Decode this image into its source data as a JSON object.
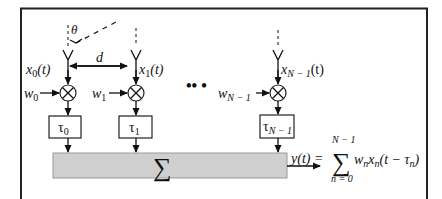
{
  "diagram": {
    "angle_label": "θ",
    "spacing_label": "d",
    "ellipsis": "•• •",
    "sum_symbol": "∑",
    "elements": [
      {
        "signal": "x",
        "signal_sub": "0",
        "signal_arg": "(t)",
        "weight": "w",
        "weight_sub": "0",
        "delay": "τ",
        "delay_sub": "0"
      },
      {
        "signal": "x",
        "signal_sub": "1",
        "signal_arg": "(t)",
        "weight": "w",
        "weight_sub": "1",
        "delay": "τ",
        "delay_sub": "1"
      },
      {
        "signal": "x",
        "signal_sub": "N − 1",
        "signal_arg": "(t)",
        "weight": "w",
        "weight_sub": "N − 1",
        "delay": "τ",
        "delay_sub": "N − 1"
      }
    ],
    "output": {
      "lhs": "y(t) =",
      "sum_symbol": "∑",
      "upper_limit": "N − 1",
      "lower_limit": "n = 0",
      "term_w": "w",
      "term_w_sub": "n",
      "term_x": "x",
      "term_x_sub": "n",
      "term_arg_open": "(t − τ",
      "term_arg_sub": "n",
      "term_arg_close": ")"
    },
    "colors": {
      "sum_fill": "#cfcfcf",
      "line": "#111111"
    }
  }
}
